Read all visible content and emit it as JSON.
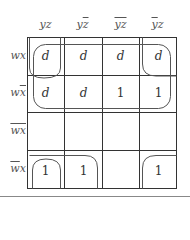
{
  "kmap": {
    "columns": [
      {
        "base": "y",
        "bar": "",
        "base2": "z",
        "bar2": "",
        "label": "yz"
      },
      {
        "base": "y",
        "bar": "",
        "base2": "",
        "bar2": "z",
        "label": "yz̄"
      },
      {
        "base": "",
        "bar": "yz",
        "base2": "",
        "bar2": "",
        "label": "ȳz̄"
      },
      {
        "base": "",
        "bar": "y",
        "base2": "z",
        "bar2": "",
        "label": "ȳz"
      }
    ],
    "rows": [
      {
        "base": "wx",
        "bar": "",
        "base2": "",
        "label": "wx"
      },
      {
        "base": "w",
        "bar": "x",
        "base2": "",
        "label": "wx̄"
      },
      {
        "base": "",
        "bar": "wx",
        "base2": "",
        "label": "w̄x̄"
      },
      {
        "base": "",
        "bar": "w",
        "base2": "x",
        "label": "w̄x"
      }
    ],
    "cells": [
      [
        "d",
        "d",
        "d",
        "d"
      ],
      [
        "d",
        "d",
        "1",
        "1"
      ],
      [
        "",
        "",
        "",
        ""
      ],
      [
        "1",
        "1",
        "",
        "1"
      ]
    ],
    "groupings": [
      "rows wx and wx̄ (all 8 cells)",
      "corners wx·yz and wx·ȳz (wrap-around)",
      "w̄x·yz and w̄x·ȳz (wrap-around)",
      "w̄x·yz and w̄x·yz̄"
    ]
  },
  "colors": {
    "grid": "#333333",
    "loop": "#555555",
    "text": "#333333"
  }
}
